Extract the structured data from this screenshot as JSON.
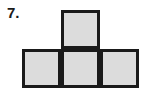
{
  "page": {
    "width": 143,
    "height": 98,
    "background_color": "#ffffff"
  },
  "problem": {
    "number_label": "7."
  },
  "figure": {
    "name": "t-shaped-polyomino",
    "square_count": 4,
    "square_size": 39,
    "fill_color": "#dcdcdc",
    "stroke_color": "#1a1a1a",
    "stroke_width": 3,
    "origin_x": 22,
    "origin_y": 10,
    "squares": [
      {
        "name": "top-square",
        "col": 1,
        "row": 0,
        "x": 61,
        "y": 10
      },
      {
        "name": "bottom-left-square",
        "col": 0,
        "row": 1,
        "x": 22,
        "y": 49
      },
      {
        "name": "bottom-middle-square",
        "col": 1,
        "row": 1,
        "x": 61,
        "y": 49
      },
      {
        "name": "bottom-right-square",
        "col": 2,
        "row": 1,
        "x": 100,
        "y": 49
      }
    ]
  }
}
